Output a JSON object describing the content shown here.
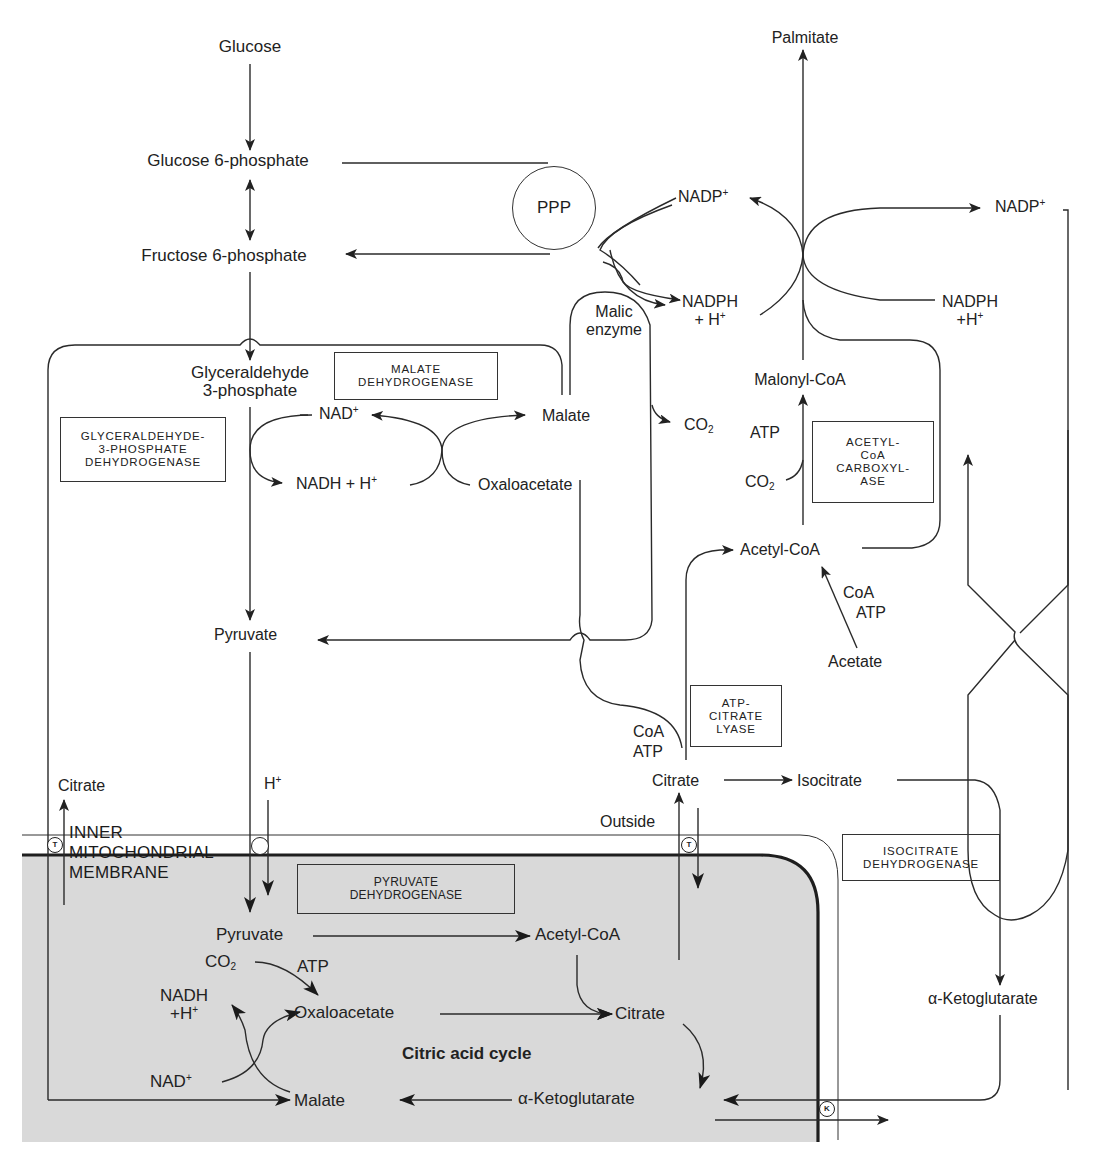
{
  "diagram": {
    "type": "metabolic-pathway",
    "colors": {
      "line": "#2a2a2a",
      "mitochondrion_fill": "#d9d9d9",
      "background": "#ffffff"
    }
  },
  "cytosol": {
    "glucose": "Glucose",
    "glucose_6_phosphate": "Glucose 6-phosphate",
    "fructose_6_phosphate": "Fructose 6-phosphate",
    "ppp": "PPP",
    "glyceraldehyde_line1": "Glyceraldehyde",
    "glyceraldehyde_line2": "3-phosphate",
    "nad_plus": "NAD",
    "nadh_h": "NADH + H",
    "malate": "Malate",
    "oxaloacetate": "Oxaloacetate",
    "malic_enzyme_line1": "Malic",
    "malic_enzyme_line2": "enzyme",
    "co2_malic": "CO",
    "nadp_plus_left": "NADP",
    "nadph_left_line1": "NADPH",
    "nadph_left_line2": "+ H",
    "palmitate": "Palmitate",
    "nadp_plus_right": "NADP",
    "nadph_right_line1": "NADPH",
    "nadph_right_line2": "+H",
    "malonyl_coa": "Malonyl-CoA",
    "atp_acc": "ATP",
    "co2_acc": "CO",
    "acetyl_coa": "Acetyl-CoA",
    "coa_acetate": "CoA",
    "atp_acetate": "ATP",
    "acetate": "Acetate",
    "pyruvate": "Pyruvate",
    "coa_acl": "CoA",
    "atp_acl": "ATP",
    "citrate": "Citrate",
    "isocitrate": "Isocitrate",
    "alpha_ketoglutarate": "α-Ketoglutarate",
    "outside": "Outside",
    "citrate_left": "Citrate",
    "h_plus": "H"
  },
  "enzymes": {
    "malate_dehydrogenase": [
      "MALATE",
      "DEHYDROGENASE"
    ],
    "gapdh": [
      "GLYCERALDEHYDE-",
      "3-PHOSPHATE",
      "DEHYDROGENASE"
    ],
    "acetyl_coa_carboxylase": [
      "ACETYL-",
      "CoA",
      "CARBOXYL-",
      "ASE"
    ],
    "atp_citrate_lyase": [
      "ATP-",
      "CITRATE",
      "LYASE"
    ],
    "isocitrate_dehydrogenase": [
      "ISOCITRATE",
      "DEHYDROGENASE"
    ],
    "pyruvate_dehydrogenase": [
      "PYRUVATE",
      "DEHYDROGENASE"
    ]
  },
  "membrane": {
    "label": [
      "INNER",
      "MITOCHONDRIAL",
      "MEMBRANE"
    ],
    "transporters": [
      {
        "id": "citrate-transporter-left",
        "symbol": "T"
      },
      {
        "id": "pyruvate-h-symporter",
        "symbol": ""
      },
      {
        "id": "citrate-transporter-right",
        "symbol": "T"
      },
      {
        "id": "ketoglutarate-transporter",
        "symbol": "K"
      }
    ]
  },
  "mitochondrion": {
    "pyruvate": "Pyruvate",
    "acetyl_coa": "Acetyl-CoA",
    "co2": "CO",
    "atp": "ATP",
    "nadh_line1": "NADH",
    "nadh_line2": "+H",
    "oxaloacetate": "Oxaloacetate",
    "citrate": "Citrate",
    "cycle_label": "Citric acid cycle",
    "nad_plus": "NAD",
    "malate": "Malate",
    "alpha_ketoglutarate": "α-Ketoglutarate"
  },
  "glyphs": {
    "plus": "+",
    "two": "2"
  }
}
